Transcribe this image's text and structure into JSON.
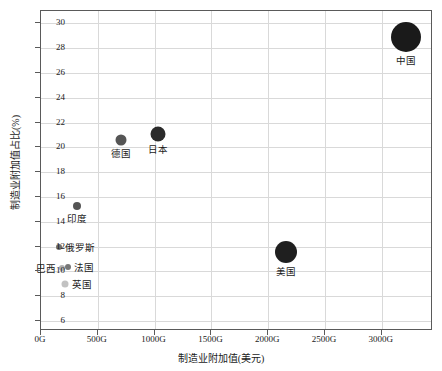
{
  "chart_data": {
    "type": "scatter",
    "title": "",
    "xlabel": "制造业附加值(美元)",
    "ylabel": "制造业附加值占比(%)",
    "xlim": [
      0,
      3450
    ],
    "ylim": [
      5.2,
      31.0
    ],
    "x_tick_labels": [
      "0G",
      "500G",
      "1000G",
      "1500G",
      "2000G",
      "2500G",
      "3000G"
    ],
    "x_tick_values": [
      0,
      500,
      1000,
      1500,
      2000,
      2500,
      3000
    ],
    "y_tick_labels": [
      "6",
      "8",
      "10",
      "12",
      "14",
      "16",
      "18",
      "20",
      "22",
      "24",
      "26",
      "28",
      "30"
    ],
    "y_tick_values": [
      6,
      8,
      10,
      12,
      14,
      16,
      18,
      20,
      22,
      24,
      26,
      28,
      30
    ],
    "grid": true,
    "legend": "none",
    "x_unit_suffix": "G",
    "points": [
      {
        "label": "中国",
        "x": 3210,
        "y": 28.9,
        "size": 30,
        "color": "#1a1a1a",
        "label_pos": "below"
      },
      {
        "label": "美国",
        "x": 2155,
        "y": 11.6,
        "size": 22,
        "color": "#1f1f1f",
        "label_pos": "below"
      },
      {
        "label": "日本",
        "x": 1030,
        "y": 21.1,
        "size": 15,
        "color": "#2b2b2b",
        "label_pos": "below"
      },
      {
        "label": "德国",
        "x": 700,
        "y": 20.6,
        "size": 11,
        "color": "#555555",
        "label_pos": "below"
      },
      {
        "label": "印度",
        "x": 320,
        "y": 15.3,
        "size": 8,
        "color": "#555555",
        "label_pos": "below"
      },
      {
        "label": "俄罗斯",
        "x": 160,
        "y": 12.0,
        "size": 6,
        "color": "#6e6e6e",
        "label_pos": "right"
      },
      {
        "label": "法国",
        "x": 235,
        "y": 10.4,
        "size": 6,
        "color": "#777777",
        "label_pos": "right"
      },
      {
        "label": "巴西",
        "x": 185,
        "y": 10.3,
        "size": 6,
        "color": "#b0b0b0",
        "label_pos": "left"
      },
      {
        "label": "英国",
        "x": 215,
        "y": 9.0,
        "size": 7,
        "color": "#c2c2c2",
        "label_pos": "right"
      }
    ]
  }
}
